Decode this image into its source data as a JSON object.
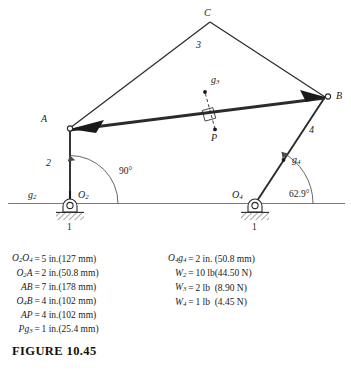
{
  "figure": {
    "caption": "FIGURE  10.45",
    "ground_label_left": "1",
    "ground_label_right": "1"
  },
  "diagram": {
    "points": {
      "A": "A",
      "B": "B",
      "C": "C",
      "P": "P",
      "O2": "O",
      "O2_sub": "2",
      "O4": "O",
      "O4_sub": "4"
    },
    "links": {
      "link2": "2",
      "link3": "3",
      "link4": "4"
    },
    "centers_of_mass": {
      "g2": "g",
      "g2_sub": "2",
      "g3": "g",
      "g3_sub": "3",
      "g4": "g",
      "g4_sub": "4"
    },
    "angles": {
      "crank_angle": "90°",
      "rocker_angle": "62.9°"
    },
    "colors": {
      "line": "#2b2b2b",
      "ground": "#6f6f6f",
      "text": "#1b1b1b"
    }
  },
  "dimensions_left": [
    {
      "symbol": "O",
      "symbol_sub": "2",
      "symbol_tail": "O",
      "symbol_tail_sub": "4",
      "equals": "=",
      "value": "5 in.",
      "si": "(127 mm)"
    },
    {
      "symbol": "O",
      "symbol_sub": "2",
      "symbol_tail": "A",
      "symbol_tail_sub": "",
      "equals": "=",
      "value": "2 in.",
      "si": "(50.8 mm)"
    },
    {
      "symbol": "A",
      "symbol_sub": "",
      "symbol_tail": "B",
      "symbol_tail_sub": "",
      "equals": "=",
      "value": "7 in.",
      "si": "(178 mm)"
    },
    {
      "symbol": "O",
      "symbol_sub": "4",
      "symbol_tail": "B",
      "symbol_tail_sub": "",
      "equals": "=",
      "value": "4 in.",
      "si": "(102 mm)"
    },
    {
      "symbol": "A",
      "symbol_sub": "",
      "symbol_tail": "P",
      "symbol_tail_sub": "",
      "equals": "=",
      "value": "4 in.",
      "si": "(102 mm)"
    },
    {
      "symbol": "P",
      "symbol_sub": "",
      "symbol_tail": "g",
      "symbol_tail_sub": "3",
      "equals": "=",
      "value": "1 in.",
      "si": "(25.4 mm)"
    }
  ],
  "dimensions_right": [
    {
      "symbol": "O",
      "symbol_sub": "4",
      "symbol_tail": "g",
      "symbol_tail_sub": "4",
      "equals": "=",
      "value": "2 in.",
      "si": "(50.8 mm)"
    },
    {
      "symbol": "W",
      "symbol_sub": "2",
      "symbol_tail": "",
      "symbol_tail_sub": "",
      "equals": "=",
      "value": "10 lb",
      "si": "(44.50 N)"
    },
    {
      "symbol": "W",
      "symbol_sub": "3",
      "symbol_tail": "",
      "symbol_tail_sub": "",
      "equals": "=",
      "value": "2 lb",
      "si": "(8.90 N)"
    },
    {
      "symbol": "W",
      "symbol_sub": "4",
      "symbol_tail": "",
      "symbol_tail_sub": "",
      "equals": "=",
      "value": "1 lb",
      "si": "(4.45 N)"
    }
  ],
  "chart_data": {
    "type": "diagram",
    "title": "FIGURE 10.45",
    "joints": [
      {
        "name": "O2",
        "x": 70,
        "y": 204,
        "type": "fixed-pivot"
      },
      {
        "name": "O4",
        "x": 255,
        "y": 204,
        "type": "fixed-pivot"
      },
      {
        "name": "A",
        "x": 70,
        "y": 128,
        "type": "pin"
      },
      {
        "name": "B",
        "x": 325,
        "y": 97,
        "type": "pin"
      },
      {
        "name": "C",
        "x": 210,
        "y": 22,
        "type": "coupler-apex"
      },
      {
        "name": "P",
        "x": 215,
        "y": 130,
        "type": "coupler-point"
      },
      {
        "name": "g3",
        "x": 205,
        "y": 92,
        "type": "center-of-mass"
      },
      {
        "name": "g4",
        "x": 283,
        "y": 160,
        "type": "center-of-mass"
      },
      {
        "name": "g2",
        "x": 70,
        "y": 196,
        "type": "center-of-mass"
      }
    ],
    "members": [
      {
        "name": "1",
        "from": "O2",
        "to": "O4",
        "length_in": 5,
        "length_mm": 127
      },
      {
        "name": "2",
        "from": "O2",
        "to": "A",
        "length_in": 2,
        "length_mm": 50.8
      },
      {
        "name": "3",
        "from": "A",
        "to": "B",
        "length_in": 7,
        "length_mm": 178
      },
      {
        "name": "4",
        "from": "O4",
        "to": "B",
        "length_in": 4,
        "length_mm": 102
      }
    ],
    "angles": [
      {
        "at": "O2",
        "value": 90,
        "unit": "deg",
        "label": "90°"
      },
      {
        "at": "O4",
        "value": 62.9,
        "unit": "deg",
        "label": "62.9°"
      }
    ],
    "weights": [
      {
        "member": "2",
        "lb": 10,
        "N": 44.5
      },
      {
        "member": "3",
        "lb": 2,
        "N": 8.9
      },
      {
        "member": "4",
        "lb": 1,
        "N": 4.45
      }
    ]
  }
}
